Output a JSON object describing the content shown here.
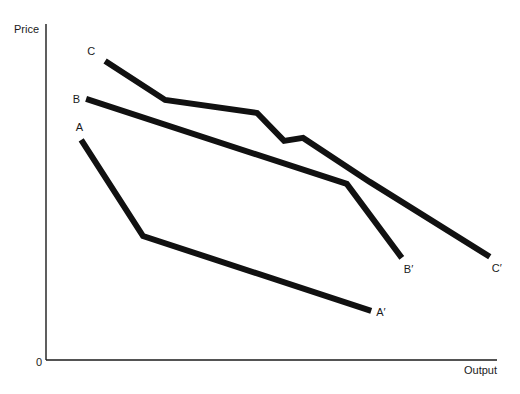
{
  "chart_data": {
    "type": "line",
    "title": "",
    "xlabel": "Output",
    "ylabel": "Price",
    "origin_label": "0",
    "xlim": [
      0,
      100
    ],
    "ylim": [
      0,
      100
    ],
    "grid": false,
    "legend": "none",
    "series": [
      {
        "name": "A",
        "start_label": "A",
        "end_label": "A′",
        "points": [
          [
            7.8,
            65.5
          ],
          [
            21.5,
            36.9
          ],
          [
            72.1,
            14.6
          ]
        ]
      },
      {
        "name": "B",
        "start_label": "B",
        "end_label": "B′",
        "points": [
          [
            8.9,
            77.7
          ],
          [
            66.7,
            52.4
          ],
          [
            78.9,
            30.4
          ]
        ]
      },
      {
        "name": "C",
        "start_label": "C",
        "end_label": "C′",
        "points": [
          [
            13.1,
            89.0
          ],
          [
            26.4,
            77.4
          ],
          [
            46.8,
            73.5
          ],
          [
            52.8,
            65.2
          ],
          [
            57.0,
            66.1
          ],
          [
            71.8,
            53.0
          ],
          [
            98.4,
            30.7
          ]
        ]
      }
    ]
  }
}
